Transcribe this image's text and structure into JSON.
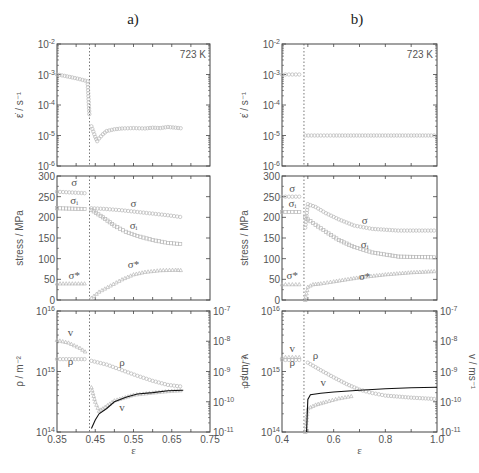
{
  "chart_data": [
    {
      "panel": "a",
      "title": "a)",
      "type": "scatter",
      "subplots": [
        {
          "name": "strain-rate",
          "ylabel": "ε̇ / s⁻¹",
          "yscale": "log",
          "ylim": [
            1e-06,
            0.01
          ],
          "yticks": [
            "10-6",
            "10-5",
            "10-4",
            "10-3",
            "10-2"
          ],
          "annotation": "723 K",
          "xlim": [
            0.35,
            0.75
          ],
          "switch_x": 0.435,
          "series": [
            {
              "name": "ε̇",
              "x": [
                0.35,
                0.37,
                0.39,
                0.41,
                0.43,
                0.435,
                0.44,
                0.45,
                0.455,
                0.46,
                0.47,
                0.48,
                0.5,
                0.52,
                0.55,
                0.58,
                0.6,
                0.62,
                0.64,
                0.66,
                0.68
              ],
              "y": [
                0.001,
                0.0009,
                0.0008,
                0.0007,
                0.0006,
                4e-05,
                2e-05,
                9e-06,
                6.5e-06,
                8e-06,
                1.1e-05,
                1.4e-05,
                1.6e-05,
                1.7e-05,
                1.75e-05,
                1.7e-05,
                1.8e-05,
                1.75e-05,
                1.9e-05,
                1.8e-05,
                1.7e-05
              ]
            }
          ]
        },
        {
          "name": "stress",
          "ylabel": "stress / MPa",
          "ylim": [
            0,
            300
          ],
          "yticks": [
            "0",
            "50",
            "100",
            "150",
            "200",
            "250",
            "300"
          ],
          "xlim": [
            0.35,
            0.75
          ],
          "series": [
            {
              "name": "σ",
              "x": [
                0.35,
                0.39,
                0.43,
                0.44,
                0.48,
                0.52,
                0.56,
                0.6,
                0.64,
                0.68
              ],
              "y": [
                262,
                260,
                258,
                222,
                220,
                217,
                213,
                209,
                205,
                200
              ]
            },
            {
              "name": "σ_i",
              "x": [
                0.35,
                0.39,
                0.43,
                0.44,
                0.47,
                0.5,
                0.53,
                0.56,
                0.6,
                0.64,
                0.68
              ],
              "y": [
                222,
                221,
                220,
                218,
                200,
                180,
                165,
                155,
                145,
                138,
                135
              ]
            },
            {
              "name": "σ*",
              "x": [
                0.35,
                0.39,
                0.43,
                0.44,
                0.46,
                0.49,
                0.52,
                0.55,
                0.58,
                0.62,
                0.66,
                0.68
              ],
              "y": [
                40,
                40,
                40,
                5,
                20,
                35,
                50,
                62,
                68,
                72,
                73,
                72
              ]
            }
          ],
          "labels": [
            {
              "text": "σ",
              "x": 0.395,
              "y": 275
            },
            {
              "text": "σᵢ",
              "x": 0.395,
              "y": 233
            },
            {
              "text": "σ*",
              "x": 0.395,
              "y": 52
            },
            {
              "text": "σ",
              "x": 0.55,
              "y": 225
            },
            {
              "text": "σᵢ",
              "x": 0.55,
              "y": 172
            },
            {
              "text": "σ*",
              "x": 0.55,
              "y": 78
            }
          ]
        },
        {
          "name": "density-velocity",
          "ylabel": "ρ / m⁻²",
          "ylabel_right": "v / ms⁻¹",
          "yscale": "log",
          "ylim": [
            100000000000000.0,
            1e+16
          ],
          "yticks": [
            "10^14",
            "10^15",
            "10^16"
          ],
          "ylim_right": [
            1e-11,
            1e-07
          ],
          "yticks_right": [
            "10^-11",
            "10^-10",
            "10^-9",
            "10^-8",
            "10^-7"
          ],
          "xlabel": "ε",
          "xlim": [
            0.35,
            0.75
          ],
          "xticks": [
            "0.35",
            "0.45",
            "0.55",
            "0.65",
            "0.75"
          ],
          "series": [
            {
              "name": "ρ",
              "x": [
                0.35,
                0.39,
                0.43,
                0.44,
                0.48,
                0.52,
                0.56,
                0.6,
                0.64,
                0.68
              ],
              "y": [
                1600000000000000.0,
                1600000000000000.0,
                1600000000000000.0,
                1500000000000000.0,
                1300000000000000.0,
                1050000000000000.0,
                850000000000000.0,
                700000000000000.0,
                600000000000000.0,
                560000000000000.0
              ]
            },
            {
              "name": "v (symbols)",
              "axis": "right",
              "x": [
                0.35,
                0.38,
                0.41,
                0.43,
                0.44,
                0.45,
                0.46,
                0.47,
                0.5,
                0.55,
                0.6,
                0.65,
                0.68
              ],
              "y": [
                1.1e-08,
                9e-09,
                6e-09,
                4e-09,
                3e-10,
                1e-10,
                5e-11,
                6e-11,
                1.1e-10,
                1.7e-10,
                2e-10,
                2.3e-10,
                2.4e-10
              ]
            },
            {
              "name": "v (line)",
              "axis": "right",
              "x": [
                0.44,
                0.45,
                0.46,
                0.48,
                0.5,
                0.53,
                0.56,
                0.6,
                0.64,
                0.68
              ],
              "y": [
                1.3e-11,
                2.5e-11,
                4e-11,
                6e-11,
                1e-10,
                1.4e-10,
                1.8e-10,
                2e-10,
                2.3e-10,
                2.4e-10
              ]
            }
          ],
          "labels": [
            {
              "text": "v",
              "x": 0.385,
              "y_right": 1.5e-08
            },
            {
              "text": "ρ",
              "x": 0.385,
              "y": 1300000000000000.0
            },
            {
              "text": "ρ",
              "x": 0.52,
              "y": 1250000000000000.0
            },
            {
              "text": "v",
              "x": 0.52,
              "y_right": 5e-11
            }
          ]
        }
      ]
    },
    {
      "panel": "b",
      "title": "b)",
      "type": "scatter",
      "subplots": [
        {
          "name": "strain-rate",
          "ylabel": "ε̇ / s⁻¹",
          "yscale": "log",
          "ylim": [
            1e-06,
            0.01
          ],
          "yticks": [
            "10-6",
            "10-5",
            "10-4",
            "10-3",
            "10-2"
          ],
          "annotation": "723 K",
          "xlim": [
            0.4,
            1.0
          ],
          "switch_x": 0.485,
          "series": [
            {
              "name": "ε̇",
              "x": [
                0.4,
                0.44,
                0.48,
                0.49,
                0.55,
                0.6,
                0.7,
                0.8,
                0.9,
                1.0
              ],
              "y": [
                0.001,
                0.001,
                0.001,
                1e-05,
                1e-05,
                1e-05,
                1e-05,
                1e-05,
                1e-05,
                1e-05
              ]
            }
          ]
        },
        {
          "name": "stress",
          "ylabel": "stress / MPa",
          "ylim": [
            0,
            300
          ],
          "yticks": [
            "0",
            "50",
            "100",
            "150",
            "200",
            "250",
            "300"
          ],
          "xlim": [
            0.4,
            1.0
          ],
          "series": [
            {
              "name": "σ",
              "x": [
                0.4,
                0.44,
                0.48,
                0.49,
                0.5,
                0.53,
                0.57,
                0.62,
                0.68,
                0.75,
                0.85,
                1.0
              ],
              "y": [
                250,
                250,
                250,
                175,
                232,
                225,
                210,
                195,
                180,
                172,
                168,
                168
              ]
            },
            {
              "name": "σ_i",
              "x": [
                0.4,
                0.44,
                0.48,
                0.49,
                0.5,
                0.53,
                0.57,
                0.62,
                0.68,
                0.75,
                0.85,
                1.0
              ],
              "y": [
                213,
                213,
                213,
                200,
                195,
                182,
                165,
                145,
                128,
                115,
                105,
                103
              ]
            },
            {
              "name": "σ*",
              "x": [
                0.4,
                0.44,
                0.48,
                0.49,
                0.5,
                0.52,
                0.55,
                0.6,
                0.7,
                0.8,
                0.9,
                1.0
              ],
              "y": [
                38,
                38,
                38,
                0,
                32,
                38,
                40,
                45,
                55,
                62,
                67,
                70
              ]
            }
          ],
          "labels": [
            {
              "text": "σ",
              "x": 0.44,
              "y": 262
            },
            {
              "text": "σᵢ",
              "x": 0.44,
              "y": 225
            },
            {
              "text": "σ*",
              "x": 0.44,
              "y": 50
            },
            {
              "text": "σ",
              "x": 0.72,
              "y": 185
            },
            {
              "text": "σᵢ",
              "x": 0.72,
              "y": 125
            },
            {
              "text": "σ*",
              "x": 0.72,
              "y": 48
            }
          ]
        },
        {
          "name": "density-velocity",
          "ylabel": "ρ / m⁻²",
          "ylabel_right": "v / ms⁻¹",
          "yscale": "log",
          "ylim": [
            100000000000000.0,
            1e+16
          ],
          "yticks": [
            "10^14",
            "10^15",
            "10^16"
          ],
          "ylim_right": [
            1e-11,
            1e-07
          ],
          "yticks_right": [
            "10^-11",
            "10^-10",
            "10^-9",
            "10^-8",
            "10^-7"
          ],
          "xlabel": "ε",
          "xlim": [
            0.4,
            1.0
          ],
          "xticks": [
            "0.4",
            "0.6",
            "0.8",
            "1.0"
          ],
          "series": [
            {
              "name": "ρ",
              "x": [
                0.4,
                0.44,
                0.48,
                0.5,
                0.55,
                0.6,
                0.65,
                0.7,
                0.75,
                0.8,
                0.9,
                1.0
              ],
              "y": [
                1550000000000000.0,
                1550000000000000.0,
                1550000000000000.0,
                1400000000000000.0,
                1050000000000000.0,
                800000000000000.0,
                620000000000000.0,
                500000000000000.0,
                440000000000000.0,
                400000000000000.0,
                370000000000000.0,
                350000000000000.0
              ]
            },
            {
              "name": "v (symbols)",
              "axis": "right",
              "x": [
                0.4,
                0.44,
                0.48,
                0.49,
                0.5,
                0.53,
                0.57,
                0.62,
                0.68
              ],
              "y": [
                3e-09,
                3e-09,
                3e-09,
                1e-11,
                6e-11,
                8e-11,
                1e-10,
                1.3e-10,
                1.6e-10
              ]
            },
            {
              "name": "v (line)",
              "axis": "right",
              "x": [
                0.495,
                0.5,
                0.51,
                0.55,
                0.6,
                0.7,
                0.8,
                0.9,
                1.0
              ],
              "y": [
                1e-11,
                1.2e-10,
                1.7e-10,
                1.9e-10,
                2.1e-10,
                2.4e-10,
                2.7e-10,
                2.9e-10,
                3e-10
              ]
            }
          ],
          "labels": [
            {
              "text": "v",
              "x": 0.44,
              "y_right": 4.5e-09
            },
            {
              "text": "ρ",
              "x": 0.44,
              "y": 1250000000000000.0
            },
            {
              "text": "ρ",
              "x": 0.53,
              "y": 1600000000000000.0
            },
            {
              "text": "v",
              "x": 0.56,
              "y_right": 3.3e-10
            }
          ]
        }
      ]
    }
  ],
  "figure": {
    "panel_a_title": "a)",
    "panel_b_title": "b)",
    "temperature": "723 K",
    "xlabel": "ε",
    "ylabel_rate": "ε̇ / s⁻¹",
    "ylabel_stress": "stress / MPa",
    "ylabel_rho": "ρ / m⁻²",
    "ylabel_v": "v / ms⁻¹"
  }
}
